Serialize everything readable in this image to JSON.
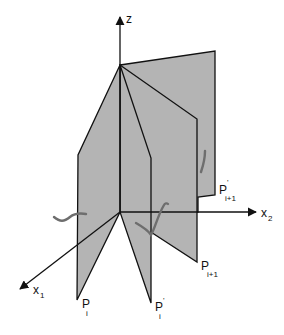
{
  "diagram": {
    "colors": {
      "plane_fill": "#b4b4b4",
      "plane_stroke": "#111111",
      "axis": "#111111",
      "curve": "#6e6e6e",
      "background": "#ffffff"
    },
    "axes": {
      "z": {
        "label": "z"
      },
      "x1": {
        "label": "x",
        "sub": "1"
      },
      "x2": {
        "label": "x",
        "sub": "2"
      }
    },
    "planes": [
      {
        "id": "P_i",
        "label": "P",
        "sub": "i",
        "prime": ""
      },
      {
        "id": "P_i_prime",
        "label": "P",
        "sub": "i",
        "prime": "'"
      },
      {
        "id": "P_i+1",
        "label": "P",
        "sub": "i+1",
        "prime": ""
      },
      {
        "id": "P_i+1_prime",
        "label": "P",
        "sub": "i+1",
        "prime": "'"
      }
    ]
  }
}
